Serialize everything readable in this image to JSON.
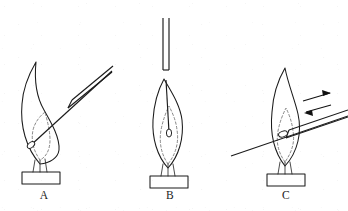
{
  "figure": {
    "background_color": "#ffffff",
    "ink_color": "#1b1b1b",
    "dashed_color": "#6a6a6a",
    "panels": [
      {
        "id": "A",
        "label": "A",
        "label_x": 44,
        "label_y": 199,
        "description": "Wire held at an angle, tip touching the lower left edge of the flame",
        "flame": {
          "name": "bunsen-flame",
          "outer_cone": "M 40 164 C 26 148 20 126 22 104 C 23 88 29 74 36 62 C 34 82 37 98 44 110 C 52 124 60 138 59 150 C 58 158 50 163 40 164 Z",
          "inner_cone_dashed": "M 40 160 C 33 150 31 140 33 130 C 35 122 40 116 45 112 C 47 120 50 130 50 140 C 50 150 46 157 40 160",
          "base_wisps": [
            "M 35 160 L 33 172",
            "M 40 160 L 40 172",
            "M 45 159 L 47 172"
          ]
        },
        "burner": {
          "name": "burner-top",
          "rect": {
            "x": 22,
            "y": 172,
            "width": 38,
            "height": 12
          }
        },
        "wire": {
          "name": "platinum-wire",
          "shaft": "M 31 145 L 112 71",
          "holder_top": "M 72 100 L 113 66",
          "holder_bottom": "M 68 108 L 112 72",
          "holder_cap": "M 68 108 L 72 100",
          "bead": {
            "cx": 31,
            "cy": 145,
            "rx": 4.2,
            "ry": 2.6,
            "angle": -40
          }
        },
        "arrows": []
      },
      {
        "id": "B",
        "label": "B",
        "label_x": 170,
        "label_y": 199,
        "description": "Wire inserted vertically from above down the centre of the flame",
        "flame": {
          "name": "bunsen-flame",
          "outer_cone": "M 168 168 C 157 156 152 138 153 120 C 154 104 158 90 164 79 C 170 90 180 104 182 120 C 184 138 179 156 168 168 Z",
          "inner_cone_dashed": "M 168 164 C 161 154 159 142 161 130 C 163 120 166 112 169 106 C 172 112 176 120 177 130 C 179 142 176 154 168 164",
          "base_wisps": [
            "M 163 164 L 161 176",
            "M 168 164 L 168 176",
            "M 173 164 L 175 176"
          ]
        },
        "burner": {
          "name": "burner-top",
          "rect": {
            "x": 150,
            "y": 176,
            "width": 38,
            "height": 12
          }
        },
        "wire": {
          "name": "platinum-wire",
          "shaft": "M 166 80 L 169 132",
          "holder_left": "M 163 18 L 163 70",
          "holder_right": "M 169 18 L 169 70",
          "holder_cap": "M 163 70 L 169 70",
          "bead": {
            "cx": 169,
            "cy": 133,
            "rx": 2.6,
            "ry": 4.0,
            "angle": 0
          }
        },
        "arrows": []
      },
      {
        "id": "C",
        "label": "C",
        "label_x": 286,
        "label_y": 199,
        "description": "Wire moved back and forth through the flame, indicated by double arrows",
        "flame": {
          "name": "bunsen-flame",
          "outer_cone": "M 285 166 C 274 152 270 132 272 112 C 273 96 278 80 285 68 C 288 84 295 100 298 114 C 302 132 298 152 285 166 Z",
          "inner_cone_dashed": "M 285 162 C 278 152 276 142 278 131 C 280 121 283 114 286 108 C 289 114 292 122 293 131 C 295 142 292 152 285 162",
          "base_wisps": [
            "M 280 162 L 278 174",
            "M 285 162 L 285 174",
            "M 290 162 L 292 174"
          ]
        },
        "burner": {
          "name": "burner-top",
          "rect": {
            "x": 267,
            "y": 174,
            "width": 38,
            "height": 12
          }
        },
        "wire": {
          "name": "platinum-wire",
          "shaft": "M 231 156 L 348 116",
          "holder_top": "M 289 130 L 348 110",
          "holder_bottom": "M 286 138 L 348 117",
          "holder_cap": "M 286 138 L 289 130",
          "bead": {
            "cx": 283,
            "cy": 134,
            "rx": 4.6,
            "ry": 2.8,
            "angle": -19
          }
        },
        "arrows": [
          {
            "name": "arrow-right",
            "line": "M 303 101 L 330 93",
            "head": "331 93 322 90 323 96"
          },
          {
            "name": "arrow-left",
            "line": "M 331 105 L 306 112",
            "head": "304 113 313 116 312 110"
          }
        ]
      }
    ]
  }
}
